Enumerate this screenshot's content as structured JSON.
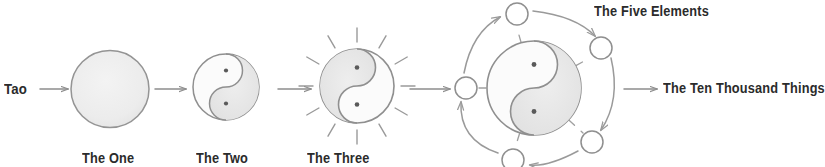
{
  "diagram": {
    "background_color": "#ffffff",
    "ink_color": "#8a8a8a",
    "text_color": "#2b2b2b",
    "fill_shade": "#e9e9e9",
    "labels": {
      "tao": "Tao",
      "the_one": "The One",
      "the_two": "The Two",
      "the_three": "The Three",
      "the_five_elements": "The Five Elements",
      "the_ten_thousand_things": "The Ten Thousand Things"
    },
    "stages": [
      {
        "index": 1,
        "name": "the-one",
        "caption": "The One",
        "glyph": "plain-circle",
        "center": [
          110,
          89
        ],
        "radius": 38
      },
      {
        "index": 2,
        "name": "the-two",
        "caption": "The Two",
        "glyph": "yin-yang",
        "center": [
          226,
          87
        ],
        "radius": 33,
        "dots": 2
      },
      {
        "index": 3,
        "name": "the-three",
        "caption": "The Three",
        "glyph": "yin-yang-with-rays",
        "center": [
          357,
          86
        ],
        "radius": 37,
        "dots": 2,
        "rays": 12
      },
      {
        "index": 4,
        "name": "the-five-elements",
        "caption": "The Five Elements",
        "glyph": "yin-yang-with-five-orbiting-circles",
        "center": [
          534,
          88
        ],
        "radius": 47,
        "dots": 2,
        "orbit_circles": 5,
        "orbit_radius": 72
      }
    ],
    "arrows": [
      {
        "name": "arrow-tao-to-one",
        "from": [
          48,
          89
        ],
        "to": [
          70,
          89
        ]
      },
      {
        "name": "arrow-one-to-two",
        "from": [
          155,
          89
        ],
        "to": [
          188,
          89
        ]
      },
      {
        "name": "arrow-two-to-three",
        "from": [
          278,
          89
        ],
        "to": [
          312,
          89
        ]
      },
      {
        "name": "arrow-three-to-five",
        "from": [
          410,
          89
        ],
        "to": [
          452,
          89
        ]
      },
      {
        "name": "arrow-five-to-ten",
        "from": [
          624,
          89
        ],
        "to": [
          659,
          89
        ]
      }
    ],
    "element_circles": [
      {
        "name": "element-circle-top",
        "center": [
          517,
          14
        ],
        "r": 11
      },
      {
        "name": "element-circle-upper-right",
        "center": [
          601,
          48
        ],
        "r": 11
      },
      {
        "name": "element-circle-lower-right",
        "center": [
          592,
          142
        ],
        "r": 11
      },
      {
        "name": "element-circle-bottom",
        "center": [
          513,
          160
        ],
        "r": 11
      },
      {
        "name": "element-circle-left",
        "center": [
          466,
          88
        ],
        "r": 11
      }
    ]
  }
}
